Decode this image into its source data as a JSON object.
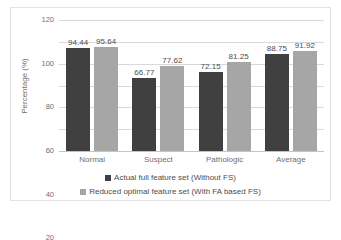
{
  "chart_data": {
    "type": "bar",
    "title": "",
    "xlabel": "",
    "ylabel": "Percentage (%)",
    "categories": [
      "Normal",
      "Suspect",
      "Pathologic",
      "Average"
    ],
    "ylim": [
      0,
      120
    ],
    "yticks": [
      0,
      20,
      40,
      60,
      80,
      100,
      120
    ],
    "ytick_labels": [
      "0",
      "20",
      "40",
      "60",
      "80",
      "100",
      "120"
    ],
    "grid": true,
    "legend_position": "bottom",
    "series": [
      {
        "name": "Actual full feature set  (Without FS)",
        "color": "#404040",
        "values": [
          94.44,
          66.77,
          72.15,
          88.75
        ],
        "labels": [
          "94.44",
          "66.77",
          "72.15",
          "88.75"
        ]
      },
      {
        "name": "Reduced optimal feature set  (With FA based FS)",
        "color": "#a6a6a6",
        "values": [
          95.64,
          77.62,
          81.25,
          91.92
        ],
        "labels": [
          "95.64",
          "77.62",
          "81.25",
          "91.92"
        ]
      }
    ]
  },
  "colors": {
    "series_dark": "#404040",
    "series_light": "#a6a6a6",
    "gridline": "#d9d9d9",
    "frame": "#e2e2e2",
    "text": "#6f6f6f",
    "background": "#ffffff"
  }
}
